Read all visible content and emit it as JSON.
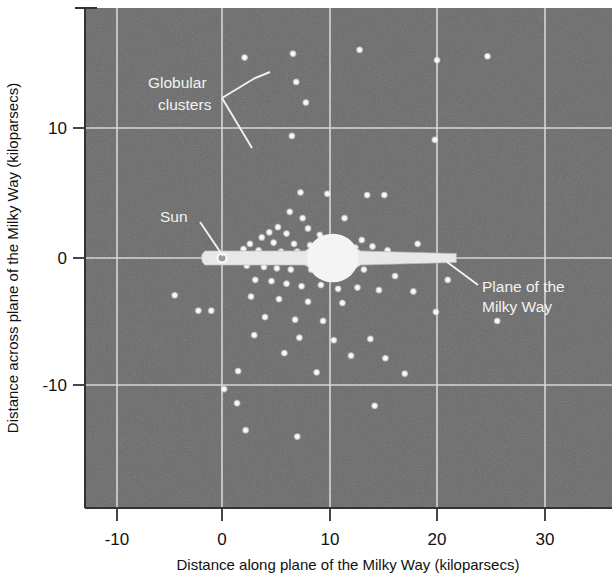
{
  "figure": {
    "kind": "scatter-plot",
    "plot_bg_color": "#6b6b6b",
    "grid_color": "#d8d8d8",
    "point_color": "#f0f0f0",
    "disk_color": "#e8e8e8",
    "text_color_outside": "#111111",
    "text_color_inside": "#f2f2f2"
  },
  "axes": {
    "x_title": "Distance along plane of the Milky Way (kiloparsecs)",
    "y_title": "Distance across plane of the Milky Way (kiloparsecs)",
    "x_ticks": [
      "-10",
      "0",
      "10",
      "20",
      "30"
    ],
    "y_ticks": [
      "10",
      "0",
      "-10"
    ]
  },
  "annotations": {
    "globular_line1": "Globular",
    "globular_line2": "clusters",
    "sun": "Sun",
    "plane_line1": "Plane of the",
    "plane_line2": "Milky Way"
  },
  "chart_data": {
    "type": "scatter",
    "title": "",
    "xlabel": "Distance along plane of the Milky Way (kiloparsecs)",
    "ylabel": "Distance across plane of the Milky Way (kiloparsecs)",
    "xlim": [
      -12.8,
      36.0
    ],
    "ylim": [
      -19.5,
      19.5
    ],
    "x_ticks": [
      -10,
      0,
      10,
      20,
      30
    ],
    "y_ticks": [
      -10,
      0,
      10
    ],
    "grid": true,
    "legend": "none",
    "units": "kiloparsecs",
    "series": [
      {
        "name": "Globular clusters",
        "marker": "circle",
        "color": "#f0f0f0",
        "points": [
          [
            2.1,
            15.6
          ],
          [
            6.6,
            15.9
          ],
          [
            12.8,
            16.2
          ],
          [
            20.0,
            15.4
          ],
          [
            6.9,
            13.7
          ],
          [
            7.8,
            12.1
          ],
          [
            24.7,
            15.7
          ],
          [
            6.5,
            9.5
          ],
          [
            19.8,
            9.2
          ],
          [
            7.3,
            5.1
          ],
          [
            9.8,
            5.0
          ],
          [
            13.5,
            4.9
          ],
          [
            15.1,
            4.9
          ],
          [
            6.3,
            3.6
          ],
          [
            7.5,
            3.1
          ],
          [
            11.4,
            3.1
          ],
          [
            8.0,
            2.3
          ],
          [
            4.4,
            2.0
          ],
          [
            5.2,
            2.4
          ],
          [
            6.0,
            1.9
          ],
          [
            9.1,
            1.8
          ],
          [
            3.7,
            1.6
          ],
          [
            10.5,
            1.6
          ],
          [
            13.0,
            1.4
          ],
          [
            2.6,
            1.1
          ],
          [
            4.8,
            1.2
          ],
          [
            6.7,
            1.1
          ],
          [
            8.2,
            1.0
          ],
          [
            11.0,
            0.9
          ],
          [
            12.4,
            0.8
          ],
          [
            14.0,
            0.9
          ],
          [
            2.0,
            0.7
          ],
          [
            3.4,
            0.6
          ],
          [
            5.5,
            0.5
          ],
          [
            7.0,
            0.5
          ],
          [
            9.5,
            0.4
          ],
          [
            10.9,
            0.5
          ],
          [
            12.0,
            0.4
          ],
          [
            15.4,
            0.6
          ],
          [
            2.3,
            -0.6
          ],
          [
            3.9,
            -0.7
          ],
          [
            5.1,
            -0.8
          ],
          [
            6.4,
            -0.9
          ],
          [
            8.3,
            -0.9
          ],
          [
            9.9,
            -0.8
          ],
          [
            11.6,
            -1.0
          ],
          [
            13.2,
            -0.9
          ],
          [
            3.1,
            -1.7
          ],
          [
            4.6,
            -1.8
          ],
          [
            6.0,
            -2.0
          ],
          [
            7.4,
            -2.2
          ],
          [
            9.2,
            -2.1
          ],
          [
            10.8,
            -2.4
          ],
          [
            12.6,
            -2.3
          ],
          [
            14.6,
            -2.5
          ],
          [
            2.7,
            -3.0
          ],
          [
            5.3,
            -3.2
          ],
          [
            8.0,
            -3.4
          ],
          [
            11.2,
            -3.5
          ],
          [
            -4.4,
            -2.9
          ],
          [
            -2.2,
            -4.1
          ],
          [
            -1.0,
            -4.1
          ],
          [
            4.0,
            -4.6
          ],
          [
            6.8,
            -4.8
          ],
          [
            9.4,
            -4.9
          ],
          [
            3.0,
            -6.0
          ],
          [
            7.2,
            -6.2
          ],
          [
            10.4,
            -6.4
          ],
          [
            13.8,
            -6.3
          ],
          [
            5.8,
            -7.4
          ],
          [
            12.0,
            -7.6
          ],
          [
            15.2,
            -7.8
          ],
          [
            1.5,
            -8.8
          ],
          [
            8.8,
            -8.9
          ],
          [
            17.0,
            -9.0
          ],
          [
            0.2,
            -10.2
          ],
          [
            1.4,
            -11.3
          ],
          [
            14.2,
            -11.5
          ],
          [
            2.2,
            -13.4
          ],
          [
            7.0,
            -13.9
          ],
          [
            19.9,
            -4.2
          ],
          [
            21.0,
            -1.7
          ],
          [
            25.6,
            -4.9
          ],
          [
            17.8,
            -2.6
          ],
          [
            16.1,
            -1.4
          ],
          [
            18.2,
            1.1
          ]
        ]
      }
    ],
    "overlay_objects": [
      {
        "name": "galactic-disk",
        "label": "Plane of the Milky Way",
        "x_start": -1.6,
        "x_end": 21.8,
        "y_center": 0.0,
        "disk_thickness_kpc": 0.55,
        "bulge_center_x": 10.3,
        "bulge_half_width_kpc": 2.6,
        "bulge_half_height_kpc": 2.1
      },
      {
        "name": "sun-marker",
        "label": "Sun",
        "x": 0.0,
        "y": 0.0,
        "marker": "open-circle"
      }
    ]
  }
}
